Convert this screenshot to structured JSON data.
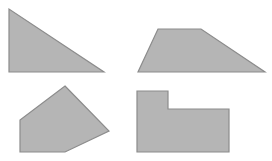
{
  "canvas": {
    "width": 272,
    "height": 161,
    "background": "#ffffff"
  },
  "style": {
    "fill": "#b5b5b5",
    "stroke": "#8c8c8c",
    "stroke_width": 1.2
  },
  "shapes": [
    {
      "name": "right-triangle",
      "points": "9,9 9,72 104,72"
    },
    {
      "name": "trapezoid",
      "points": "158,29 201,29 265,72 138,72"
    },
    {
      "name": "pentagon",
      "points": "65,86 109,131 65,152 20,152 20,120"
    },
    {
      "name": "l-shape",
      "points": "137,91 168,91 168,109 229,109 229,152 137,152"
    }
  ]
}
